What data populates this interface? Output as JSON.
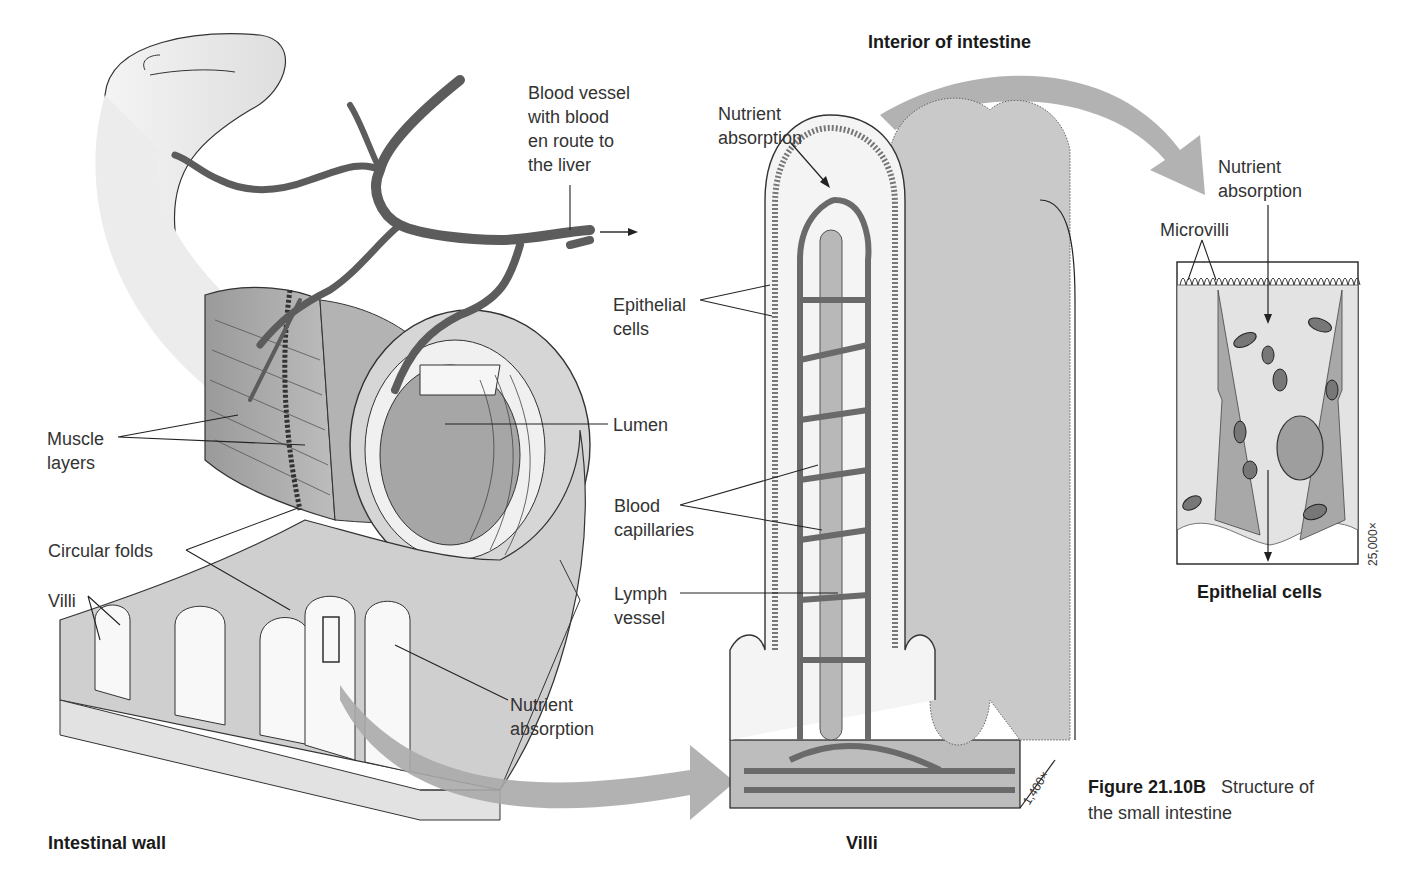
{
  "figure": {
    "number": "Figure 21.10B",
    "caption_line1": "Structure of",
    "caption_line2": "the small intestine"
  },
  "panels": {
    "intestinal_wall": {
      "title": "Intestinal wall",
      "labels": {
        "blood_vessel": "Blood vessel\nwith blood\nen route to\nthe liver",
        "muscle_layers": "Muscle\nlayers",
        "circular_folds": "Circular folds",
        "villi": "Villi",
        "lumen": "Lumen",
        "nutrient_absorption": "Nutrient\nabsorption"
      }
    },
    "villi": {
      "header": "Interior of intestine",
      "title": "Villi",
      "magnification": "1,400×",
      "labels": {
        "nutrient_absorption": "Nutrient\nabsorption",
        "epithelial_cells": "Epithelial\ncells",
        "blood_capillaries": "Blood\ncapillaries",
        "lymph_vessel": "Lymph\nvessel"
      }
    },
    "epithelial_cells": {
      "title": "Epithelial cells",
      "magnification": "25,000×",
      "labels": {
        "nutrient_absorption": "Nutrient\nabsorption",
        "microvilli": "Microvilli"
      }
    }
  },
  "colors": {
    "tissue_light": "#e6e6e6",
    "tissue_mid": "#c4c4c4",
    "tissue_dark": "#a8a8a8",
    "vessel": "#6e6e6e",
    "arrow_gray": "#a9a9a9",
    "line": "#222222"
  }
}
